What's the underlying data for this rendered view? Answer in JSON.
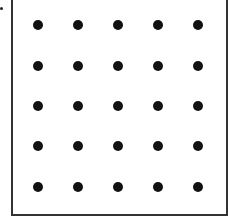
{
  "diagram": {
    "type": "dot-grid",
    "rows": 5,
    "cols": 5,
    "dot_color": "#111111",
    "frame_color": "#333333",
    "col_x": [
      38,
      78,
      118,
      158,
      198
    ],
    "row_y": [
      25,
      66,
      106,
      146,
      187
    ]
  }
}
